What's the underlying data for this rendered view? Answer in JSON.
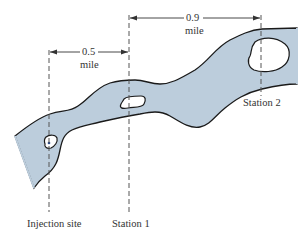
{
  "diagram": {
    "colors": {
      "river_fill": "#bccddc",
      "outline": "#1a1a1a",
      "dashed_line": "#555555",
      "text": "#333333",
      "injection_dot": "#2a4a8a"
    },
    "locations": [
      {
        "id": "injection",
        "label": "Injection site"
      },
      {
        "id": "station1",
        "label": "Station 1"
      },
      {
        "id": "station2",
        "label": "Station 2"
      }
    ],
    "dimensions": [
      {
        "from": "Injection site",
        "to": "Station 1",
        "value": "0.5",
        "unit": "mile"
      },
      {
        "from": "Station 1",
        "to": "Station 2",
        "value": "0.9",
        "unit": "mile"
      }
    ]
  }
}
